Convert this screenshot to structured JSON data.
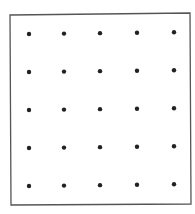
{
  "diagram": {
    "type": "dot-grid",
    "rows": 5,
    "cols": 5,
    "frame": {
      "corners": [
        [
          10,
          15
        ],
        [
          190,
          13
        ],
        [
          191,
          204
        ],
        [
          11,
          205
        ]
      ],
      "stroke": "#555555",
      "stroke_width": 1.3
    },
    "dots": {
      "color": "#222222",
      "radius": 2.2,
      "col_x": [
        29,
        64,
        100,
        137,
        174
      ],
      "row_y": [
        34,
        72,
        110,
        148,
        186
      ],
      "row_slope": -0.012
    }
  }
}
